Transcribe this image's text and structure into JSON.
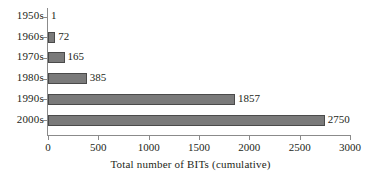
{
  "chart_data": {
    "type": "bar",
    "orientation": "horizontal",
    "title": "",
    "xlabel": "Total number of BITs (cumulative)",
    "ylabel": "",
    "categories": [
      "1950s",
      "1960s",
      "1970s",
      "1980s",
      "1990s",
      "2000s"
    ],
    "values": [
      1,
      72,
      165,
      385,
      1857,
      2750
    ],
    "value_labels": [
      "1",
      "72",
      "165",
      "385",
      "1857",
      "2750"
    ],
    "xlim": [
      0,
      3000
    ],
    "xticks": [
      0,
      500,
      1000,
      1500,
      2000,
      2500,
      3000
    ],
    "xtick_labels": [
      "0",
      "500",
      "1000",
      "1500",
      "2000",
      "2500",
      "3000"
    ],
    "grid": false,
    "legend": false,
    "bar_color": "#7a7a7a",
    "bar_border_color": "#4a4a4a",
    "axis_color": "#8b8b8b",
    "background": "#ffffff",
    "text_color": "#231f20"
  }
}
